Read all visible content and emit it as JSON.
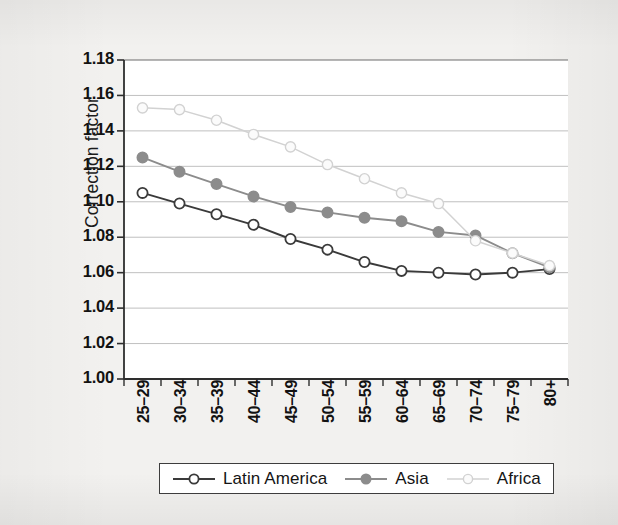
{
  "chart_data": {
    "type": "line",
    "title": "",
    "xlabel": "",
    "ylabel": "Correction factor",
    "ylim": [
      1.0,
      1.18
    ],
    "ytick_step": 0.02,
    "grid": true,
    "legend_position": "bottom",
    "categories": [
      "25–29",
      "30–34",
      "35–39",
      "40–44",
      "45–49",
      "50–54",
      "55–59",
      "60–64",
      "65–69",
      "70–74",
      "75–79",
      "80+"
    ],
    "ytick_labels": [
      "1.18",
      "1.16",
      "1.14",
      "1.12",
      "1.10",
      "1.08",
      "1.06",
      "1.04",
      "1.02",
      "1.00"
    ],
    "ytick_values": [
      1.18,
      1.16,
      1.14,
      1.12,
      1.1,
      1.08,
      1.06,
      1.04,
      1.02,
      1.0
    ],
    "series": [
      {
        "name": "Latin America",
        "color": "#3a3a3a",
        "marker": "open-circle",
        "marker_fill": "#ffffff",
        "values": [
          1.105,
          1.099,
          1.093,
          1.087,
          1.079,
          1.073,
          1.066,
          1.061,
          1.06,
          1.059,
          1.06,
          1.062
        ]
      },
      {
        "name": "Asia",
        "color": "#8c8c8c",
        "marker": "filled-circle",
        "marker_fill": "#8c8c8c",
        "values": [
          1.125,
          1.117,
          1.11,
          1.103,
          1.097,
          1.094,
          1.091,
          1.089,
          1.083,
          1.081,
          1.071,
          1.063
        ]
      },
      {
        "name": "Africa",
        "color": "#d2d2d2",
        "marker": "open-circle",
        "marker_fill": "#fbfbfb",
        "values": [
          1.153,
          1.152,
          1.146,
          1.138,
          1.131,
          1.121,
          1.113,
          1.105,
          1.099,
          1.078,
          1.071,
          1.064
        ]
      }
    ]
  },
  "axis": {
    "y_title": "Correction factor"
  },
  "legend": {
    "items": [
      {
        "label": "Latin America"
      },
      {
        "label": "Asia"
      },
      {
        "label": "Africa"
      }
    ]
  }
}
